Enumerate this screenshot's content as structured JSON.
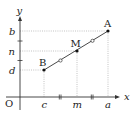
{
  "diagram": {
    "type": "coordinate-geometry",
    "axes": {
      "x_label": "x",
      "y_label": "y",
      "origin_label": "O"
    },
    "points": [
      {
        "id": "A",
        "label": "A",
        "x_label": "a",
        "y_label": "b"
      },
      {
        "id": "M",
        "label": "M",
        "x_label": "m",
        "y_label": "n"
      },
      {
        "id": "B",
        "label": "B",
        "x_label": "c",
        "y_label": "d"
      }
    ],
    "x_ticks": [
      "c",
      "m",
      "a"
    ],
    "y_ticks": [
      "b",
      "n",
      "d"
    ],
    "markers": {
      "segment_equal_marks": "circle",
      "axis_equal_marks": "double-tick"
    },
    "colors": {
      "stroke": "#333333",
      "guide": "#9a9a9a",
      "background": "#ffffff"
    }
  }
}
